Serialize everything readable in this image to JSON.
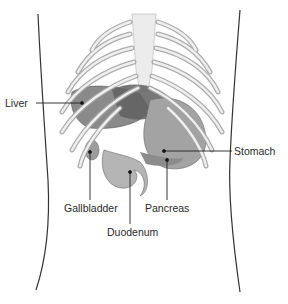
{
  "figure": {
    "colors": {
      "background": "#ffffff",
      "bone": "#e2e2e2",
      "bone_shade": "#a9a9a9",
      "organ_dark": "#6e6e6e",
      "organ_mid": "#9a9a9a",
      "organ_light": "#bdbdbd",
      "outline": "#333333",
      "label_text": "#2a2a2a"
    }
  },
  "labels": [
    {
      "id": "liver",
      "text": "Liver"
    },
    {
      "id": "stomach",
      "text": "Stomach"
    },
    {
      "id": "gallbladder",
      "text": "Gallbladder"
    },
    {
      "id": "pancreas",
      "text": "Pancreas"
    },
    {
      "id": "duodenum",
      "text": "Duodenum"
    }
  ]
}
